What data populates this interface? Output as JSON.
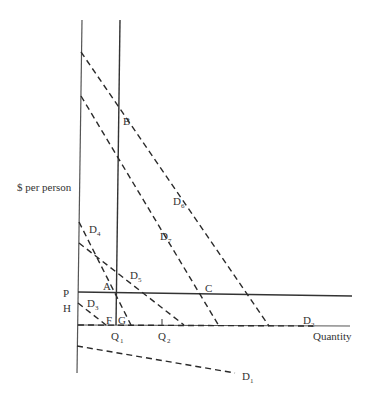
{
  "diagram": {
    "y_axis_label": "$ per person",
    "x_axis_label": "Quantity",
    "colors": {
      "line": "#2a2a2a",
      "axis": "#555555",
      "background": "#ffffff"
    },
    "point_labels": {
      "A": "A",
      "B": "B",
      "C": "C",
      "F": "F",
      "G": "G",
      "P": "P",
      "H": "H"
    },
    "quantity_labels": [
      {
        "main": "Q",
        "sub": "1"
      },
      {
        "main": "Q",
        "sub": "2"
      }
    ],
    "curves": [
      {
        "id": "D1",
        "main": "D",
        "sub": "1"
      },
      {
        "id": "D2",
        "main": "D",
        "sub": "2"
      },
      {
        "id": "D3",
        "main": "D",
        "sub": "3"
      },
      {
        "id": "D4",
        "main": "D",
        "sub": "4"
      },
      {
        "id": "D5",
        "main": "D",
        "sub": "5"
      },
      {
        "id": "D6",
        "main": "D",
        "sub": "6"
      },
      {
        "id": "D7",
        "main": "D",
        "sub": "7"
      }
    ]
  }
}
